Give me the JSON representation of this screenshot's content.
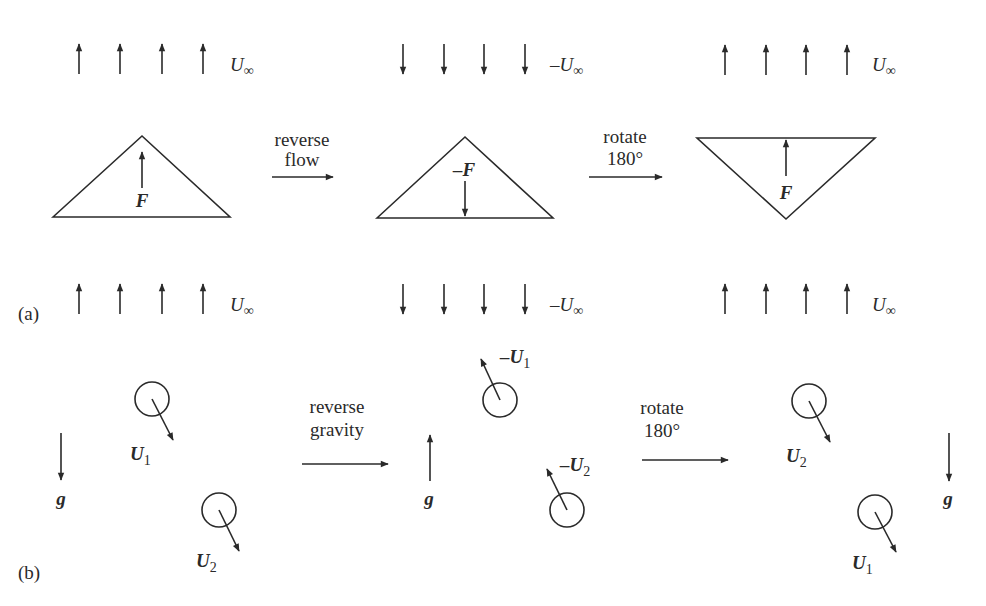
{
  "figure": {
    "panel_a": {
      "label": "(a)",
      "stages": [
        {
          "flow_label": "U",
          "flow_sub": "∞",
          "flow_sign": "",
          "flow_direction": "up",
          "force_label": "F",
          "force_sign": "",
          "force_direction": "up",
          "triangle": "apex-up"
        },
        {
          "flow_label": "U",
          "flow_sub": "∞",
          "flow_sign": "–",
          "flow_direction": "down",
          "force_label": "F",
          "force_sign": "–",
          "force_direction": "down",
          "triangle": "apex-up"
        },
        {
          "flow_label": "U",
          "flow_sub": "∞",
          "flow_sign": "",
          "flow_direction": "up",
          "force_label": "F",
          "force_sign": "",
          "force_direction": "up",
          "triangle": "apex-down"
        }
      ],
      "transitions": [
        {
          "line1": "reverse",
          "line2": "flow"
        },
        {
          "line1": "rotate",
          "line2": "180°"
        }
      ]
    },
    "panel_b": {
      "label": "(b)",
      "stages": [
        {
          "flow_label": "U",
          "flow_sub": "∞",
          "flow_sign": "",
          "gravity_label": "g",
          "gravity_direction": "down",
          "particles": [
            {
              "label": "U",
              "sub": "1",
              "sign": ""
            },
            {
              "label": "U",
              "sub": "2",
              "sign": ""
            }
          ]
        },
        {
          "flow_label": "U",
          "flow_sub": "∞",
          "flow_sign": "–",
          "gravity_label": "g",
          "gravity_direction": "up",
          "particles": [
            {
              "label": "U",
              "sub": "1",
              "sign": "–"
            },
            {
              "label": "U",
              "sub": "2",
              "sign": "–"
            }
          ]
        },
        {
          "flow_label": "U",
          "flow_sub": "∞",
          "flow_sign": "",
          "gravity_label": "g",
          "gravity_direction": "down",
          "particles": [
            {
              "label": "U",
              "sub": "2",
              "sign": ""
            },
            {
              "label": "U",
              "sub": "1",
              "sign": ""
            }
          ]
        }
      ],
      "transitions": [
        {
          "line1": "reverse",
          "line2": "gravity"
        },
        {
          "line1": "rotate",
          "line2": "180°"
        }
      ]
    },
    "colors": {
      "ink": "#2a2a2a",
      "background": "#ffffff"
    }
  }
}
